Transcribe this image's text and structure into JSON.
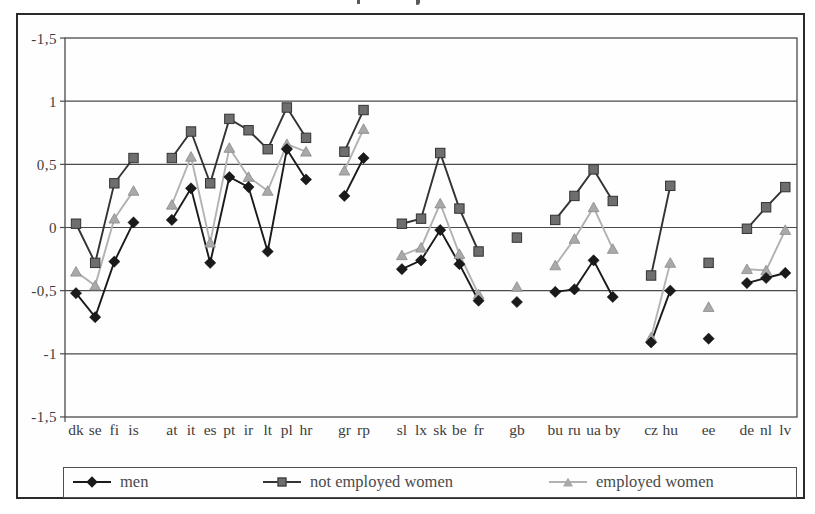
{
  "page": {
    "background": "#ffffff",
    "border_color": "#2a2a2a"
  },
  "chart_data": {
    "type": "line",
    "title": "",
    "grid": true,
    "legend_position": "bottom",
    "y_axis": {
      "tick_labels": [
        "-1,5",
        "1",
        "0,5",
        "0",
        "-0,5",
        "-1",
        "-1,5"
      ],
      "tick_values": [
        1.5,
        1,
        0.5,
        0,
        -0.5,
        -1,
        -1.5
      ],
      "range": [
        -1.5,
        1.5
      ],
      "decimal_style": "comma"
    },
    "x_axis": {
      "groups": [
        [
          "dk",
          "se",
          "fi",
          "is"
        ],
        [
          "at",
          "it",
          "es",
          "pt",
          "ir",
          "lt",
          "pl",
          "hr"
        ],
        [
          "gr",
          "rp"
        ],
        [
          "sl",
          "lx",
          "sk",
          "be",
          "fr"
        ],
        [
          "gb"
        ],
        [
          "bu",
          "ru",
          "ua",
          "by"
        ],
        [
          "cz",
          "hu"
        ],
        [
          "ee"
        ],
        [
          "de",
          "nl",
          "lv"
        ]
      ]
    },
    "series": [
      {
        "name": "men",
        "marker": "diamond",
        "marker_color": "#1a1a1a",
        "line_color": "#1a1a1a",
        "values_by_group": [
          [
            -0.52,
            -0.71,
            -0.27,
            0.04
          ],
          [
            0.06,
            0.31,
            -0.28,
            0.4,
            0.32,
            -0.19,
            0.62,
            0.38
          ],
          [
            0.25,
            0.55
          ],
          [
            -0.33,
            -0.26,
            -0.02,
            -0.29,
            -0.58
          ],
          [
            -0.59
          ],
          [
            -0.51,
            -0.49,
            -0.26,
            -0.55
          ],
          [
            -0.91,
            -0.5
          ],
          [
            -0.88
          ],
          [
            -0.44,
            -0.4,
            -0.36
          ]
        ]
      },
      {
        "name": "not employed women",
        "marker": "square",
        "marker_color": "#6e6e6e",
        "line_color": "#333333",
        "values_by_group": [
          [
            0.03,
            -0.28,
            0.35,
            0.55
          ],
          [
            0.55,
            0.76,
            0.35,
            0.86,
            0.77,
            0.62,
            0.95,
            0.71
          ],
          [
            0.6,
            0.93
          ],
          [
            0.03,
            0.07,
            0.59,
            0.15,
            -0.19
          ],
          [
            -0.08
          ],
          [
            0.06,
            0.25,
            0.46,
            0.21
          ],
          [
            -0.38,
            0.33
          ],
          [
            -0.28
          ],
          [
            -0.01,
            0.16,
            0.32
          ]
        ]
      },
      {
        "name": "employed women",
        "marker": "triangle",
        "marker_color": "#a9a9a9",
        "line_color": "#b2b2b2",
        "values_by_group": [
          [
            -0.35,
            -0.46,
            0.07,
            0.29
          ],
          [
            0.18,
            0.56,
            -0.12,
            0.63,
            0.4,
            0.29,
            0.66,
            0.6
          ],
          [
            0.45,
            0.78
          ],
          [
            -0.22,
            -0.16,
            0.19,
            -0.21,
            -0.53
          ],
          [
            -0.47
          ],
          [
            -0.3,
            -0.09,
            0.16,
            -0.17
          ],
          [
            -0.87,
            -0.28
          ],
          [
            -0.63
          ],
          [
            -0.33,
            -0.34,
            -0.02
          ]
        ]
      }
    ]
  },
  "legend": {
    "items": [
      {
        "label": "men"
      },
      {
        "label": "not employed women"
      },
      {
        "label": "employed women"
      }
    ]
  }
}
